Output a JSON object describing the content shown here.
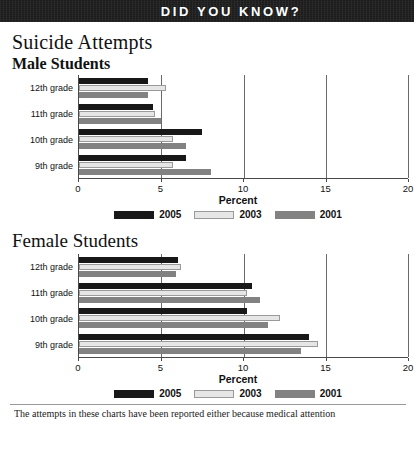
{
  "banner": {
    "title": "DID YOU KNOW?"
  },
  "page_title": "Suicide Attempts",
  "legend": {
    "items": [
      {
        "label": "2005",
        "key": "s2005",
        "color": "#181818"
      },
      {
        "label": "2003",
        "key": "s2003",
        "color": "#e6e6e6"
      },
      {
        "label": "2001",
        "key": "s2001",
        "color": "#828282"
      }
    ]
  },
  "axis": {
    "title": "Percent",
    "ticks": [
      "0",
      "5",
      "10",
      "15",
      "20"
    ]
  },
  "caption": "The attempts in these charts have been reported either because medical attention",
  "chart_data": [
    {
      "type": "bar",
      "orientation": "horizontal",
      "title": "Suicide Attempts",
      "subtitle": "Male Students",
      "xlabel": "Percent",
      "ylabel": "",
      "xlim": [
        0,
        20
      ],
      "xticks": [
        0,
        5,
        10,
        15,
        20
      ],
      "grid": true,
      "legend_position": "bottom",
      "categories": [
        "12th grade",
        "11th grade",
        "10th grade",
        "9th grade"
      ],
      "series": [
        {
          "name": "2005",
          "color": "#181818",
          "values": [
            4.2,
            4.5,
            7.5,
            6.5
          ]
        },
        {
          "name": "2003",
          "color": "#e6e6e6",
          "values": [
            5.3,
            4.6,
            5.7,
            5.7
          ]
        },
        {
          "name": "2001",
          "color": "#828282",
          "values": [
            4.2,
            5.0,
            6.5,
            8.0
          ]
        }
      ]
    },
    {
      "type": "bar",
      "orientation": "horizontal",
      "title": "Suicide Attempts",
      "subtitle": "Female Students",
      "xlabel": "Percent",
      "ylabel": "",
      "xlim": [
        0,
        20
      ],
      "xticks": [
        0,
        5,
        10,
        15,
        20
      ],
      "grid": true,
      "legend_position": "bottom",
      "categories": [
        "12th grade",
        "11th grade",
        "10th grade",
        "9th grade"
      ],
      "series": [
        {
          "name": "2005",
          "color": "#181818",
          "values": [
            6.0,
            10.5,
            10.2,
            14.0
          ]
        },
        {
          "name": "2003",
          "color": "#e6e6e6",
          "values": [
            6.2,
            10.2,
            12.2,
            14.5
          ]
        },
        {
          "name": "2001",
          "color": "#828282",
          "values": [
            5.9,
            11.0,
            11.5,
            13.5
          ]
        }
      ]
    }
  ]
}
